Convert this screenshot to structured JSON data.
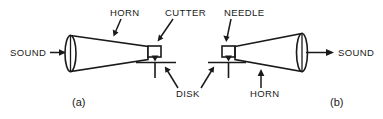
{
  "figure": {
    "background_color": "#ffffff",
    "line_color": "#1a1a1a"
  },
  "labels": {
    "horn_top": "HORN",
    "cutter": "CUTTER",
    "needle": "NEEDLE",
    "disk": "DISK",
    "horn_bottom": "HORN",
    "sound_left": "SOUND",
    "sound_right": "SOUND"
  },
  "panels": [
    {
      "id": "a",
      "caption": "(a)"
    },
    {
      "id": "b",
      "caption": "(b)"
    }
  ],
  "icons": {
    "arrow_in": "arrow-right-icon",
    "arrow_out": "arrow-right-icon",
    "cutter_tip": "triangle-down-icon",
    "needle_tip": "triangle-down-icon"
  }
}
